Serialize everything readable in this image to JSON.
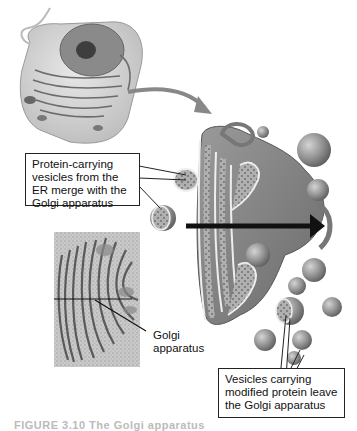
{
  "figure": {
    "callouts": {
      "er_vesicles": "Protein-carrying vesicles from the ER merge with the Golgi apparatus",
      "leaving_vesicles": "Vesicles carrying modified protein leave the Golgi apparatus"
    },
    "micrograph_label_line1": "Golgi",
    "micrograph_label_line2": "apparatus",
    "caption": "FIGURE 3.10 The Golgi apparatus"
  },
  "colors": {
    "background": "#ffffff",
    "membrane": "#8a8a8a",
    "membrane_dark": "#555555",
    "lumen": "#b9b9b9",
    "arrow": "#111111",
    "cell_body": "#d8d8d8",
    "nucleus": "#7a7a7a"
  }
}
